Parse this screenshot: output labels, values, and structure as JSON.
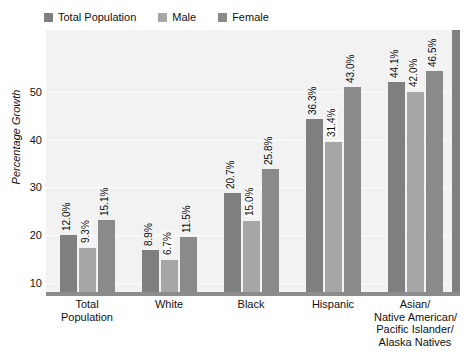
{
  "chart_data": {
    "type": "bar",
    "title": "",
    "xlabel": "",
    "ylabel": "Percentage Growth",
    "ylim": [
      0,
      55
    ],
    "yticks": [
      10,
      20,
      30,
      40,
      50
    ],
    "grid": true,
    "legend_position": "top-left",
    "categories": [
      [
        "Total",
        "Population"
      ],
      [
        "White"
      ],
      [
        "Black"
      ],
      [
        "Hispanic"
      ],
      [
        "Asian/",
        "Native American/",
        "Pacific Islander/",
        "Alaska Natives"
      ]
    ],
    "category_names": [
      "Total Population",
      "White",
      "Black",
      "Hispanic",
      "Asian/Native American/Pacific Islander/Alaska Natives"
    ],
    "series": [
      {
        "name": "Total Population",
        "color": "#7f7f7f",
        "values": [
          12.0,
          8.9,
          20.7,
          36.3,
          44.1
        ],
        "labels": [
          "12.0%",
          "8.9%",
          "20.7%",
          "36.3%",
          "44.1%"
        ]
      },
      {
        "name": "Male",
        "color": "#a6a6a6",
        "values": [
          9.3,
          6.7,
          15.0,
          31.4,
          42.0
        ],
        "labels": [
          "9.3%",
          "6.7%",
          "15.0%",
          "31.4%",
          "42.0%"
        ]
      },
      {
        "name": "Female",
        "color": "#8a8a8a",
        "values": [
          15.1,
          11.5,
          25.8,
          43.0,
          46.5
        ],
        "labels": [
          "15.1%",
          "11.5%",
          "25.8%",
          "43.0%",
          "46.5%"
        ]
      }
    ]
  },
  "legend": {
    "items": [
      {
        "label": "Total Population",
        "color": "#7f7f7f"
      },
      {
        "label": "Male",
        "color": "#a6a6a6"
      },
      {
        "label": "Female",
        "color": "#8a8a8a"
      }
    ]
  },
  "axes": {
    "y_title": "Percentage Growth",
    "y_tick_labels": [
      "50",
      "40",
      "30",
      "20",
      "10"
    ]
  },
  "colors": {
    "plot_background": "#f2f2f2",
    "gridline": "#ffffff",
    "baseline": "#8c8c8c",
    "right_edge": "#808080",
    "text": "#111111"
  }
}
